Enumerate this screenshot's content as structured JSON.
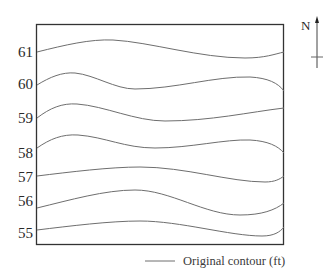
{
  "diagram": {
    "type": "contour-map",
    "north_label": "N",
    "legend": {
      "label": "Original contour (ft)"
    },
    "contours": [
      {
        "elevation": "61",
        "label_y": 57
      },
      {
        "elevation": "60",
        "label_y": 89
      },
      {
        "elevation": "59",
        "label_y": 123
      },
      {
        "elevation": "58",
        "label_y": 158
      },
      {
        "elevation": "57",
        "label_y": 182
      },
      {
        "elevation": "56",
        "label_y": 206
      },
      {
        "elevation": "55",
        "label_y": 238
      }
    ],
    "colors": {
      "frame": "#333333",
      "contour": "#6e6e6e",
      "text": "#2a2a2a"
    }
  }
}
